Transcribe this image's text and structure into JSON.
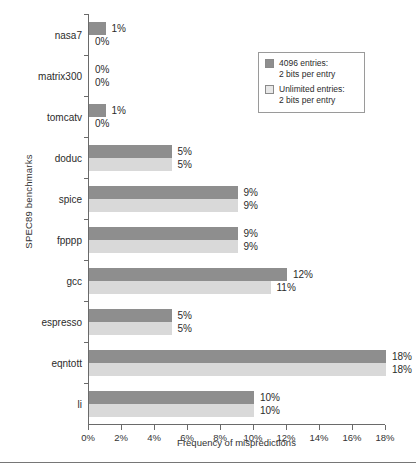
{
  "chart_data": {
    "type": "bar",
    "orientation": "horizontal",
    "title": "",
    "xlabel": "Frequency of mispredictions",
    "ylabel": "SPEC89 benchmarks",
    "xlim": [
      0,
      18
    ],
    "xticks": [
      "0%",
      "2%",
      "4%",
      "6%",
      "8%",
      "10%",
      "12%",
      "14%",
      "16%",
      "18%"
    ],
    "xtick_values": [
      0,
      2,
      4,
      6,
      8,
      10,
      12,
      14,
      16,
      18
    ],
    "grid": false,
    "legend_position": "upper right",
    "categories": [
      "nasa7",
      "matrix300",
      "tomcatv",
      "doduc",
      "spice",
      "fpppp",
      "gcc",
      "espresso",
      "eqntott",
      "li"
    ],
    "series": [
      {
        "name": "4096 entries: 2 bits per entry",
        "color": "#8e8e8e",
        "values": [
          1,
          0,
          1,
          5,
          9,
          9,
          12,
          5,
          18,
          10
        ],
        "labels": [
          "1%",
          "0%",
          "1%",
          "5%",
          "9%",
          "9%",
          "12%",
          "5%",
          "18%",
          "10%"
        ]
      },
      {
        "name": "Unlimited entries: 2 bits per entry",
        "color": "#d9d9d9",
        "values": [
          0,
          0,
          0,
          5,
          9,
          9,
          11,
          5,
          18,
          10
        ],
        "labels": [
          "0%",
          "0%",
          "0%",
          "5%",
          "9%",
          "9%",
          "11%",
          "5%",
          "18%",
          "10%"
        ]
      }
    ]
  },
  "legend": {
    "entries": [
      {
        "swatch": "dark",
        "line1": "4096 entries:",
        "line2": "2 bits per entry"
      },
      {
        "swatch": "light",
        "line1": "Unlimited entries:",
        "line2": "2 bits per entry"
      }
    ]
  },
  "colors": {
    "series_dark": "#8e8e8e",
    "series_light": "#d9d9d9",
    "axis": "#6a6a6a",
    "text": "#2b2b2b",
    "background": "#ffffff"
  }
}
